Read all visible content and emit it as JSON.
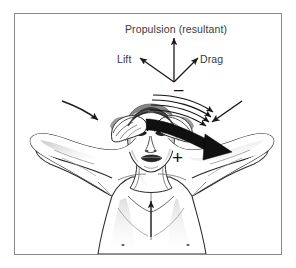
{
  "figure": {
    "title": "Propulsion (resultant)",
    "frame": {
      "border_color": "#8a8a8a",
      "background": "#ffffff"
    },
    "labels": {
      "propulsion": "Propulsion (resultant)",
      "lift": "Lift",
      "drag": "Drag",
      "negative_pressure_sign": "–",
      "positive_pressure_sign": "+"
    },
    "vectors": [
      {
        "name": "propulsion-resultant",
        "label": "Propulsion (resultant)",
        "direction": "up",
        "origin": [
          174,
          82
        ],
        "tip": [
          174,
          37
        ],
        "color": "#1a1a1a"
      },
      {
        "name": "lift",
        "label": "Lift",
        "direction": "up-left",
        "origin": [
          174,
          82
        ],
        "tip": [
          139,
          57
        ],
        "color": "#1a1a1a"
      },
      {
        "name": "drag",
        "label": "Drag",
        "direction": "up-right",
        "origin": [
          174,
          82
        ],
        "tip": [
          199,
          57
        ],
        "color": "#1a1a1a"
      },
      {
        "name": "hand-sweep-force",
        "label": "",
        "direction": "down-right",
        "origin": [
          150,
          123
        ],
        "tip": [
          228,
          155
        ],
        "color": "#111111",
        "style": "thick-solid"
      },
      {
        "name": "body-lift-arrow",
        "label": "",
        "direction": "up",
        "origin": [
          151,
          235
        ],
        "tip": [
          151,
          200
        ],
        "color": "#1a1a1a",
        "style": "thin"
      },
      {
        "name": "water-inflow-left",
        "label": "",
        "direction": "curved-down-right",
        "color": "#1a1a1a",
        "style": "curved"
      },
      {
        "name": "water-inflow-right",
        "label": "",
        "direction": "curved-down-left",
        "color": "#1a1a1a",
        "style": "curved"
      }
    ],
    "streamlines": {
      "name": "flow-streamlines",
      "count": 4,
      "direction": "left-to-right curving down",
      "color": "#111111"
    },
    "subject": {
      "name": "swimmer-figure",
      "description": "Front view of a swimmer with both arms raised and hands sweeping across the head"
    },
    "pressure_markers": [
      {
        "name": "low-pressure-marker",
        "sign": "–",
        "position": [
          176,
          90
        ]
      },
      {
        "name": "high-pressure-marker",
        "sign": "+",
        "position": [
          178,
          157
        ]
      }
    ]
  }
}
